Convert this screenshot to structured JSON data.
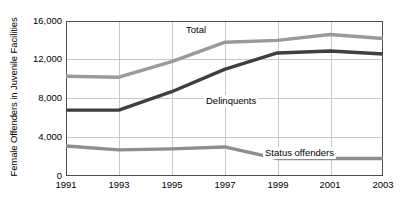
{
  "chart_data": {
    "type": "line",
    "title": "",
    "xlabel": "",
    "ylabel": "Female Offenders in Juvenile Facilities",
    "x": [
      1991,
      1993,
      1995,
      1997,
      1999,
      2001,
      2003
    ],
    "categories": [
      "1991",
      "1993",
      "1995",
      "1997",
      "1999",
      "2001",
      "2003"
    ],
    "series": [
      {
        "name": "Total",
        "color": "#9a9a9a",
        "values": [
          10300,
          10200,
          11800,
          13800,
          14000,
          14600,
          14200
        ]
      },
      {
        "name": "Delinquents",
        "color": "#3f3f3f",
        "values": [
          6800,
          6800,
          8700,
          11000,
          12700,
          12900,
          12600
        ]
      },
      {
        "name": "Status offenders",
        "color": "#8e8e8e",
        "values": [
          3100,
          2700,
          2800,
          3000,
          1800,
          1800,
          1800
        ]
      }
    ],
    "ylim": [
      0,
      16000
    ],
    "xlim": [
      1991,
      2003
    ],
    "yticks": [
      0,
      4000,
      8000,
      12000,
      16000
    ],
    "ytick_labels": [
      "0",
      "4,000",
      "8,000",
      "12,000",
      "16,000"
    ],
    "grid": true,
    "legend_position": "inline-annotations",
    "annotations": [
      {
        "text": "Total",
        "series": "Total"
      },
      {
        "text": "Delinquents",
        "series": "Delinquents"
      },
      {
        "text": "Status offenders",
        "series": "Status offenders"
      }
    ],
    "colors": {
      "axis": "#4d4d4d",
      "grid": "#c8c8c8",
      "background": "#ffffff",
      "text": "#000000"
    }
  }
}
